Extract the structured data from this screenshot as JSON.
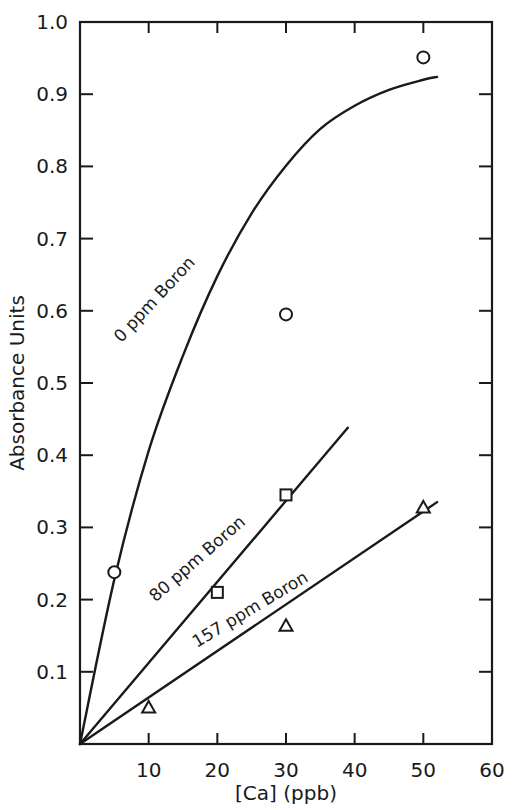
{
  "chart_data": {
    "type": "scatter",
    "title": "",
    "xlabel": "[Ca] (ppb)",
    "ylabel": "Absorbance Units",
    "xlim": [
      0,
      60
    ],
    "ylim": [
      0,
      1.0
    ],
    "grid": false,
    "legend_position": "inline-curve-labels",
    "xticks": [
      10,
      20,
      30,
      40,
      50,
      60
    ],
    "xtick_labels": [
      "10",
      "20",
      "30",
      "40",
      "50",
      "60"
    ],
    "yticks": [
      0.1,
      0.2,
      0.3,
      0.4,
      0.5,
      0.6,
      0.7,
      0.8,
      0.9,
      1.0
    ],
    "ytick_labels": [
      "0.1",
      "0.2",
      "0.3",
      "0.4",
      "0.5",
      "0.6",
      "0.7",
      "0.8",
      "0.9",
      "1.0"
    ],
    "series": [
      {
        "name": "0 ppm Boron",
        "label": "0 ppm Boron",
        "marker": "circle",
        "points": [
          {
            "x": 5,
            "y": 0.238
          },
          {
            "x": 30,
            "y": 0.595
          },
          {
            "x": 50,
            "y": 0.951
          }
        ],
        "fit_curve": [
          {
            "x": 0,
            "y": 0.0
          },
          {
            "x": 5,
            "y": 0.228
          },
          {
            "x": 10,
            "y": 0.406
          },
          {
            "x": 15,
            "y": 0.538
          },
          {
            "x": 20,
            "y": 0.648
          },
          {
            "x": 25,
            "y": 0.735
          },
          {
            "x": 30,
            "y": 0.801
          },
          {
            "x": 35,
            "y": 0.852
          },
          {
            "x": 40,
            "y": 0.884
          },
          {
            "x": 45,
            "y": 0.906
          },
          {
            "x": 50,
            "y": 0.92
          },
          {
            "x": 52,
            "y": 0.924
          }
        ]
      },
      {
        "name": "80 ppm Boron",
        "label": "80 ppm Boron",
        "marker": "square",
        "points": [
          {
            "x": 20,
            "y": 0.21
          },
          {
            "x": 30,
            "y": 0.345
          }
        ],
        "fit_curve": [
          {
            "x": 0,
            "y": 0.0
          },
          {
            "x": 39,
            "y": 0.438
          }
        ]
      },
      {
        "name": "157 ppm Boron",
        "label": "157 ppm Boron",
        "marker": "triangle",
        "points": [
          {
            "x": 10,
            "y": 0.05
          },
          {
            "x": 30,
            "y": 0.163
          },
          {
            "x": 50,
            "y": 0.327
          }
        ],
        "fit_curve": [
          {
            "x": 0,
            "y": 0.0
          },
          {
            "x": 52,
            "y": 0.335
          }
        ]
      }
    ]
  },
  "colors": {
    "ink": "#1a1a1a",
    "background": "#ffffff"
  }
}
